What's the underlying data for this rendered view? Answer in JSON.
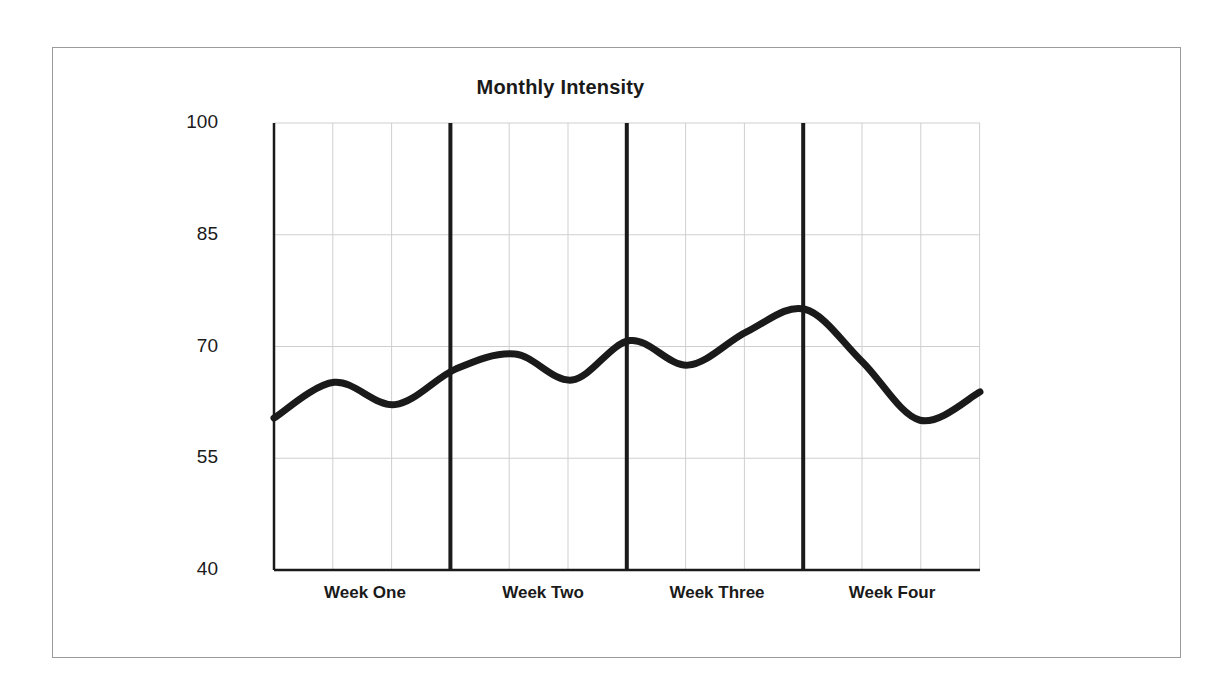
{
  "figure": {
    "background_color": "#ffffff",
    "frame_color": "#9b9b9b"
  },
  "chart_data": {
    "type": "line",
    "title": "Monthly Intensity",
    "xlabel": "",
    "ylabel": "Relative Training Intensity (%)",
    "ylim": [
      40,
      100
    ],
    "y_ticks": [
      100,
      85,
      70,
      55,
      40
    ],
    "y_tick_labels": [
      "100",
      "85",
      "70",
      "55",
      "40"
    ],
    "categories": [
      "Week One",
      "Week Two",
      "Week Three",
      "Week Four"
    ],
    "x_tick_labels": [
      "Week One",
      "Week Two",
      "Week Three",
      "Week Four"
    ],
    "grid": true,
    "grid_color": "#cfcfcf",
    "minor_columns_per_week": 3,
    "week_divider_color": "#1a1a1a",
    "legend": null,
    "series": [
      {
        "name": "Relative Training Intensity",
        "color": "#1a1a1a",
        "line_width": 7,
        "x": [
          0,
          1,
          2,
          3,
          4,
          5,
          6,
          7,
          8,
          9,
          10,
          11,
          12
        ],
        "x_positions_px": [
          274,
          334,
          395,
          456,
          515,
          572,
          630,
          688,
          747,
          805,
          862,
          920,
          980
        ],
        "values": [
          60.4,
          65.2,
          62.2,
          67.0,
          69.0,
          65.5,
          70.8,
          67.5,
          72.0,
          75.0,
          68.0,
          60.1,
          63.9
        ]
      }
    ],
    "annotations": []
  },
  "axes_geometry": {
    "plot_left_px": 274,
    "plot_right_px": 980,
    "plot_top_px": 123,
    "plot_bottom_px": 570
  }
}
